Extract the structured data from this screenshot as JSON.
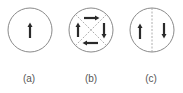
{
  "figure": {
    "panels": [
      {
        "label": "(a)",
        "description": "single domain, magnetization up",
        "arrows": [
          "up"
        ],
        "divider": "none"
      },
      {
        "label": "(b)",
        "description": "four closure domains, clockwise",
        "arrows": [
          "right (top)",
          "down (right)",
          "left (bottom)",
          "up (left)"
        ],
        "divider": "dashed diagonals"
      },
      {
        "label": "(c)",
        "description": "two domains, antiparallel",
        "arrows": [
          "up (left)",
          "down (right)"
        ],
        "divider": "dashed vertical"
      }
    ],
    "colors": {
      "circle": "#8a8a8a",
      "arrow": "#2a2a2a",
      "divider": "#999999",
      "label": "#555555"
    }
  }
}
